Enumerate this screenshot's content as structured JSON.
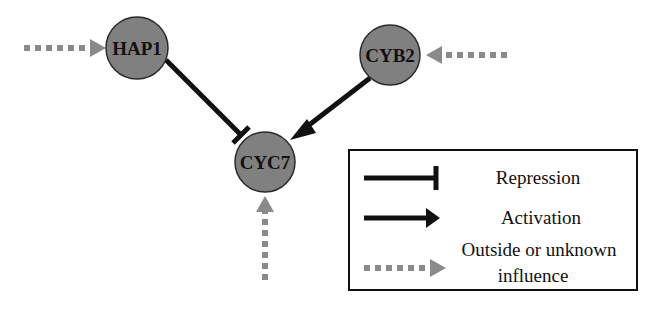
{
  "diagram": {
    "type": "gene-regulatory-network",
    "colors": {
      "node_fill": "#808080",
      "node_stroke": "#2a2a2a",
      "edge": "#111111",
      "outside_influence": "#8a8a8a"
    },
    "nodes": [
      {
        "id": "HAP1",
        "label": "HAP1",
        "cx": 137,
        "cy": 48,
        "r": 31
      },
      {
        "id": "CYB2",
        "label": "CYB2",
        "cx": 390,
        "cy": 55,
        "r": 30
      },
      {
        "id": "CYC7",
        "label": "CYC7",
        "cx": 265,
        "cy": 162,
        "r": 30
      }
    ],
    "edges": [
      {
        "from": "HAP1",
        "to": "CYC7",
        "type": "repression"
      },
      {
        "from": "CYB2",
        "to": "CYC7",
        "type": "activation"
      },
      {
        "from": "outside",
        "to": "HAP1",
        "type": "outside-or-unknown-influence"
      },
      {
        "from": "outside",
        "to": "CYB2",
        "type": "outside-or-unknown-influence"
      },
      {
        "from": "outside",
        "to": "CYC7",
        "type": "outside-or-unknown-influence"
      }
    ],
    "legend": {
      "items": [
        {
          "type": "repression",
          "label": "Repression"
        },
        {
          "type": "activation",
          "label": "Activation"
        },
        {
          "type": "outside-or-unknown-influence",
          "label_line1": "Outside or unknown",
          "label_line2": "influence"
        }
      ]
    }
  }
}
